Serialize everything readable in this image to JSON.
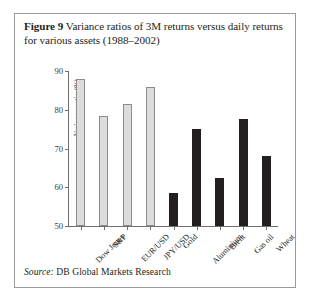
{
  "caption": {
    "figure_label": "Figure 9",
    "title": "Variance ratios of 3M returns versus daily returns for various assets (1988–2002)"
  },
  "source": {
    "label": "Source:",
    "text": "DB Global Markets Research"
  },
  "chart_data": {
    "type": "bar",
    "title": "Variance ratios of 3M returns versus daily returns for various assets (1988–2002)",
    "xlabel": "",
    "ylabel": "Variance ratio (%)",
    "ylim": [
      50,
      90
    ],
    "yticks": [
      50,
      60,
      70,
      80,
      90
    ],
    "grid": false,
    "legend": "none",
    "categories": [
      "Dow Jones",
      "S&P",
      "EUR/USD",
      "JPY/USD",
      "Gold",
      "Aluminium",
      "Brent",
      "Gas oil",
      "Wheat"
    ],
    "values": [
      88,
      78.5,
      81.5,
      86,
      58.5,
      75,
      62.5,
      77.5,
      68
    ],
    "colors": [
      "#dcdcdc",
      "#dcdcdc",
      "#dcdcdc",
      "#dcdcdc",
      "#231f20",
      "#231f20",
      "#231f20",
      "#231f20",
      "#231f20"
    ],
    "series": [
      {
        "name": "Variance ratio (%)",
        "values": [
          88,
          78.5,
          81.5,
          86,
          58.5,
          75,
          62.5,
          77.5,
          68
        ]
      }
    ]
  }
}
